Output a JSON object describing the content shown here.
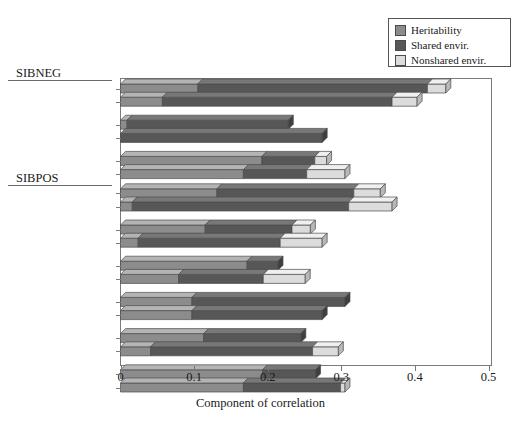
{
  "legend": {
    "items": [
      {
        "label": "Heritability",
        "color": "#8c8c8c",
        "icon": "square-swatch"
      },
      {
        "label": "Shared envir.",
        "color": "#575757",
        "icon": "square-swatch"
      },
      {
        "label": "Nonshared envir.",
        "color": "#dcdcdc",
        "icon": "square-swatch"
      }
    ]
  },
  "axis": {
    "xlabel": "Component of correlation",
    "ticks": [
      "0",
      "0.1",
      "0.2",
      "0.3",
      "0.4",
      "0.5"
    ],
    "xmin": 0,
    "xmax": 0.5
  },
  "groups": [
    {
      "name": "SIBNEG"
    },
    {
      "name": "SIBPOS"
    }
  ],
  "chart_data": {
    "type": "bar",
    "orientation": "horizontal",
    "stacked": true,
    "title": "",
    "xlabel": "Component of correlation",
    "ylabel": "",
    "xlim": [
      0,
      0.5
    ],
    "grid": false,
    "legend_position": "top-right",
    "series": [
      {
        "name": "Heritability",
        "color": "#8c8c8c"
      },
      {
        "name": "Shared envir.",
        "color": "#575757"
      },
      {
        "name": "Nonshared envir.",
        "color": "#dcdcdc"
      }
    ],
    "groups": [
      {
        "group": "SIBNEG",
        "rows": [
          {
            "category": "Antisocial beh. t1",
            "values": [
              0.105,
              0.312,
              0.025
            ],
            "total": 0.442
          },
          {
            "category": "Antisocial beh. t2",
            "values": [
              0.057,
              0.312,
              0.034
            ],
            "total": 0.403
          },
          {
            "category": "Depression t1",
            "values": [
              0.009,
              0.219,
              0.0
            ],
            "total": 0.228
          },
          {
            "category": "Depression t2",
            "values": [
              0.0,
              0.274,
              0.0
            ],
            "total": 0.274
          },
          {
            "category": "Social respons. t1 (-)",
            "values": [
              0.192,
              0.072,
              0.016
            ],
            "total": 0.28
          },
          {
            "category": "Social respons. t2 (-)",
            "values": [
              0.167,
              0.086,
              0.052
            ],
            "total": 0.305
          }
        ]
      },
      {
        "group": "SIBPOS",
        "rows": [
          {
            "category": "Antisocial beh. t1 (-)",
            "values": [
              0.131,
              0.186,
              0.036
            ],
            "total": 0.353
          },
          {
            "category": "Antisocial beh. t2 (-)",
            "values": [
              0.016,
              0.294,
              0.059
            ],
            "total": 0.369
          },
          {
            "category": "Depression t1 (-)",
            "values": [
              0.115,
              0.118,
              0.025
            ],
            "total": 0.258
          },
          {
            "category": "Depression t2 (-)",
            "values": [
              0.024,
              0.193,
              0.057
            ],
            "total": 0.274
          },
          {
            "category": "Cog. agency t1",
            "values": [
              0.172,
              0.042,
              0.0
            ],
            "total": 0.214
          },
          {
            "category": "Cog. agency t2",
            "values": [
              0.079,
              0.115,
              0.057
            ],
            "total": 0.251
          },
          {
            "category": "Sociability t1",
            "values": [
              0.097,
              0.208,
              0.0
            ],
            "total": 0.305
          },
          {
            "category": "Sociability t2",
            "values": [
              0.097,
              0.177,
              0.0
            ],
            "total": 0.274
          },
          {
            "category": "Autonomy t1",
            "values": [
              0.113,
              0.132,
              0.0
            ],
            "total": 0.245
          },
          {
            "category": "Autonomy t2",
            "values": [
              0.041,
              0.22,
              0.035
            ],
            "total": 0.296
          },
          {
            "category": "Social respons. t1",
            "values": [
              0.193,
              0.072,
              0.0
            ],
            "total": 0.265
          },
          {
            "category": "Social respons. t2",
            "values": [
              0.167,
              0.132,
              0.006
            ],
            "total": 0.305
          }
        ]
      }
    ]
  }
}
